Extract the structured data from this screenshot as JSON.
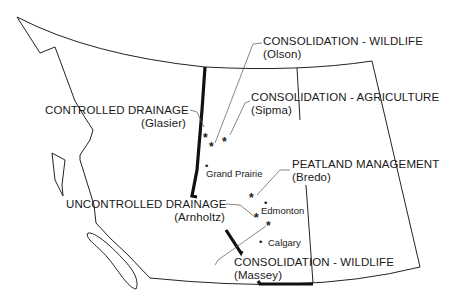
{
  "map": {
    "type": "regional wetland project map",
    "region_border_color": "#222222",
    "project_labels": [
      {
        "category": "CONSOLIDATION  -  WILDLIFE",
        "name": "(Olson)"
      },
      {
        "category": "CONTROLLED  DRAINAGE",
        "name": "(Glasier)"
      },
      {
        "category": "CONSOLIDATION  -  AGRICULTURE",
        "name": "(Sipma)"
      },
      {
        "category": "PEATLAND  MANAGEMENT",
        "name": "(Bredo)"
      },
      {
        "category": "UNCONTROLLED  DRAINAGE",
        "name": "(Arnholtz)"
      },
      {
        "category": "CONSOLIDATION  -  WILDLIFE",
        "name": "(Massey)"
      }
    ],
    "cities": [
      {
        "name": "Grand  Prairie"
      },
      {
        "name": "Edmonton"
      },
      {
        "name": "Calgary"
      }
    ],
    "site_marker": "*",
    "city_marker": "•"
  }
}
